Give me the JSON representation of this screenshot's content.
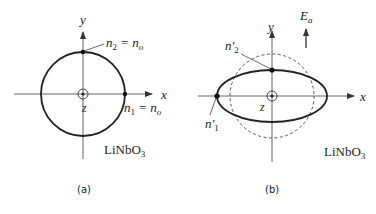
{
  "figure": {
    "panel_a": {
      "caption": "(a)",
      "material": "LiNbO",
      "material_subscript": "3",
      "axes": {
        "x": "x",
        "y": "y",
        "z": "z"
      },
      "labels": {
        "n2_main": "n",
        "n2_sub": "2",
        "n2_rest": " = n",
        "n2_rest_sub": "o",
        "n1_main": "n",
        "n1_sub": "1",
        "n1_rest": " = n",
        "n1_rest_sub": "o"
      },
      "shape": "circle",
      "description": "Index ellipse cross-section without applied field: circle with n1 = n2 = no"
    },
    "panel_b": {
      "caption": "(b)",
      "material": "LiNbO",
      "material_subscript": "3",
      "axes": {
        "x": "x",
        "y": "y",
        "z": "z"
      },
      "field_label": "E",
      "field_sub": "a",
      "labels": {
        "n2p_main": "n′",
        "n2p_sub": "2",
        "n1p_main": "n′",
        "n1p_sub": "1"
      },
      "shape": "ellipse",
      "description": "Index ellipse with applied field Ea along y: ellipse elongated along x, original circle shown dashed"
    }
  }
}
